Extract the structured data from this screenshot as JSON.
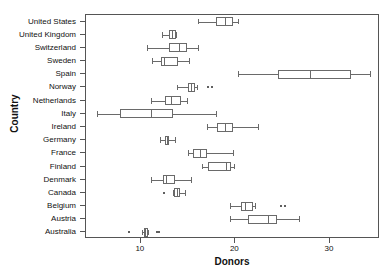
{
  "chart_data": {
    "type": "box",
    "title": "",
    "xlabel": "Donors",
    "ylabel": "Country",
    "xlim": [
      4.2,
      35.3
    ],
    "xticks": [
      10,
      20,
      30
    ],
    "xticklabels": [
      "10",
      "20",
      "30"
    ],
    "grid": false,
    "orientation": "horizontal",
    "categories": [
      "United States",
      "United Kingdom",
      "Switzerland",
      "Sweden",
      "Spain",
      "Norway",
      "Netherlands",
      "Italy",
      "Ireland",
      "Germany",
      "France",
      "Finland",
      "Denmark",
      "Canada",
      "Belgium",
      "Austria",
      "Australia"
    ],
    "boxes": [
      {
        "category": "United States",
        "whisker_low": 16.0,
        "q1": 17.9,
        "median": 18.9,
        "q3": 19.8,
        "whisker_high": 20.3,
        "outliers": []
      },
      {
        "category": "United Kingdom",
        "whisker_low": 12.2,
        "q1": 13.0,
        "median": 13.3,
        "q3": 13.7,
        "whisker_high": 13.7,
        "outliers": []
      },
      {
        "category": "Switzerland",
        "whisker_low": 10.7,
        "q1": 13.0,
        "median": 14.0,
        "q3": 14.9,
        "whisker_high": 16.0,
        "outliers": []
      },
      {
        "category": "Sweden",
        "whisker_low": 11.2,
        "q1": 12.1,
        "median": 12.4,
        "q3": 13.9,
        "whisker_high": 15.1,
        "outliers": []
      },
      {
        "category": "Spain",
        "whisker_low": 20.3,
        "q1": 24.5,
        "median": 27.9,
        "q3": 32.2,
        "whisker_high": 34.2,
        "outliers": []
      },
      {
        "category": "Norway",
        "whisker_low": 13.8,
        "q1": 15.0,
        "median": 15.3,
        "q3": 15.7,
        "whisker_high": 15.9,
        "outliers": [
          17.1,
          17.5
        ]
      },
      {
        "category": "Netherlands",
        "whisker_low": 11.1,
        "q1": 12.6,
        "median": 13.2,
        "q3": 14.2,
        "whisker_high": 14.9,
        "outliers": []
      },
      {
        "category": "Italy",
        "whisker_low": 5.4,
        "q1": 7.8,
        "median": 11.1,
        "q3": 13.4,
        "whisker_high": 18.0,
        "outliers": []
      },
      {
        "category": "Ireland",
        "whisker_low": 17.0,
        "q1": 18.1,
        "median": 18.9,
        "q3": 19.8,
        "whisker_high": 22.4,
        "outliers": []
      },
      {
        "category": "Germany",
        "whisker_low": 12.0,
        "q1": 12.6,
        "median": 12.8,
        "q3": 13.0,
        "whisker_high": 13.6,
        "outliers": []
      },
      {
        "category": "France",
        "whisker_low": 15.0,
        "q1": 15.5,
        "median": 16.3,
        "q3": 17.0,
        "whisker_high": 19.8,
        "outliers": []
      },
      {
        "category": "Finland",
        "whisker_low": 16.5,
        "q1": 17.1,
        "median": 19.0,
        "q3": 19.5,
        "whisker_high": 19.9,
        "outliers": []
      },
      {
        "category": "Denmark",
        "whisker_low": 11.1,
        "q1": 12.3,
        "median": 12.7,
        "q3": 13.6,
        "whisker_high": 15.3,
        "outliers": []
      },
      {
        "category": "Canada",
        "whisker_low": 13.4,
        "q1": 13.5,
        "median": 13.8,
        "q3": 14.1,
        "whisker_high": 14.7,
        "outliers": [
          12.5
        ]
      },
      {
        "category": "Belgium",
        "whisker_low": 19.4,
        "q1": 20.6,
        "median": 21.0,
        "q3": 21.9,
        "whisker_high": 22.1,
        "outliers": [
          24.8,
          25.3
        ]
      },
      {
        "category": "Austria",
        "whisker_low": 19.4,
        "q1": 21.3,
        "median": 23.4,
        "q3": 24.4,
        "whisker_high": 26.7,
        "outliers": []
      },
      {
        "category": "Australia",
        "whisker_low": 10.1,
        "q1": 10.3,
        "median": 10.4,
        "q3": 10.8,
        "whisker_high": 10.8,
        "outliers": [
          8.7,
          11.7,
          11.9
        ]
      }
    ]
  },
  "axes": {
    "x_title": "Donors",
    "y_title": "Country"
  },
  "colors": {
    "box_stroke": "#6a6a6a",
    "axis": "#555555",
    "text": "#111111",
    "outlier": "#2b2b2b",
    "background": "#ffffff"
  }
}
